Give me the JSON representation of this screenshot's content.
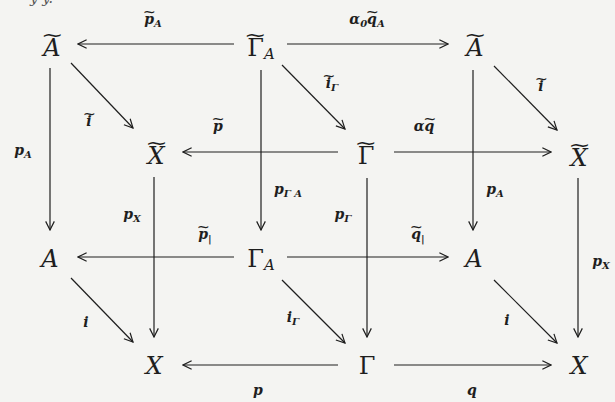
{
  "cutoff_text": "y   y.",
  "nodes": {
    "tl_A_tilde": {
      "base": "A",
      "tilde": true,
      "sub": ""
    },
    "tm_GammaA_tilde": {
      "base": "Γ",
      "tilde": true,
      "sub": "A"
    },
    "tr_A_tilde": {
      "base": "A",
      "tilde": true,
      "sub": ""
    },
    "ml_X_tilde": {
      "base": "X",
      "tilde": true,
      "sub": ""
    },
    "mm_Gamma_tilde": {
      "base": "Γ",
      "tilde": true,
      "sub": ""
    },
    "mr_X_tilde": {
      "base": "X",
      "tilde": true,
      "sub": ""
    },
    "bl_A": {
      "base": "A",
      "tilde": false,
      "sub": ""
    },
    "bm_GammaA": {
      "base": "Γ",
      "tilde": false,
      "sub": "A"
    },
    "br_A": {
      "base": "A",
      "tilde": false,
      "sub": ""
    },
    "xl_X": {
      "base": "X",
      "tilde": false,
      "sub": ""
    },
    "xm_Gamma": {
      "base": "Γ",
      "tilde": false,
      "sub": ""
    },
    "xr_X": {
      "base": "X",
      "tilde": false,
      "sub": ""
    }
  },
  "labels": {
    "p_A_tilde": {
      "base": "p",
      "tilde": true,
      "sub": "A"
    },
    "alpha0_qA_tilde": {
      "prefix": "α",
      "prefix_sub": "0",
      "base": "q",
      "tilde": true,
      "sub": "A"
    },
    "i_tilde_left": {
      "base": "i",
      "tilde": true,
      "sub": ""
    },
    "i_Gamma_tilde": {
      "base": "i",
      "tilde": true,
      "sub": "Γ"
    },
    "i_tilde_right": {
      "base": "i",
      "tilde": true,
      "sub": ""
    },
    "p_tilde": {
      "base": "p",
      "tilde": true,
      "sub": ""
    },
    "alpha_q_tilde": {
      "prefix": "α",
      "prefix_sub": "",
      "base": "q",
      "tilde": true,
      "sub": ""
    },
    "p_A_left": {
      "base": "p",
      "tilde": false,
      "sub": "A"
    },
    "p_GammaA": {
      "base": "p",
      "tilde": false,
      "sub": "Γ A"
    },
    "p_A_right": {
      "base": "p",
      "tilde": false,
      "sub": "A"
    },
    "p_X_left": {
      "base": "p",
      "tilde": false,
      "sub": "X"
    },
    "p_Gamma": {
      "base": "p",
      "tilde": false,
      "sub": "Γ"
    },
    "p_X_right": {
      "base": "p",
      "tilde": false,
      "sub": "X"
    },
    "p_restricted_tilde": {
      "base": "p",
      "tilde": true,
      "sub": "|"
    },
    "q_restricted_tilde": {
      "base": "q",
      "tilde": true,
      "sub": "|"
    },
    "i_left": {
      "base": "i",
      "tilde": false,
      "sub": ""
    },
    "i_Gamma": {
      "base": "i",
      "tilde": false,
      "sub": "Γ"
    },
    "i_right": {
      "base": "i",
      "tilde": false,
      "sub": ""
    },
    "p_bottom": {
      "base": "p",
      "tilde": false,
      "sub": ""
    },
    "q_bottom": {
      "base": "q",
      "tilde": false,
      "sub": ""
    }
  },
  "colors": {
    "ink": "#1e1e1e",
    "background": "#f4f4f2"
  }
}
